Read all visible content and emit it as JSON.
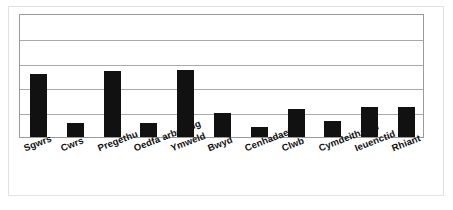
{
  "chart_data": {
    "type": "bar",
    "title": "",
    "subtitle": "",
    "xlabel": "",
    "ylabel": "",
    "grid": true,
    "legend": false,
    "legend_position": "none",
    "axis_tick_labels": [],
    "ylim": [
      0,
      5
    ],
    "y_gridline_values": [
      1,
      2,
      3,
      4,
      5
    ],
    "categories": [
      "Sgwrs",
      "Cwrs",
      "Pregethu",
      "Oedfa arbennig",
      "Ymweld",
      "Bwyd",
      "Cenhadaeth",
      "Clwb",
      "Cymdeithasol",
      "Ieuenctid",
      "Rhiant"
    ],
    "values": [
      2.54,
      0.56,
      2.66,
      0.56,
      2.7,
      0.97,
      0.4,
      1.13,
      0.65,
      1.21,
      1.21
    ],
    "bar_color": "#111111",
    "gridline_color": "#a9a9a9",
    "plot_border_color": "#9a9a9a",
    "background_color": "#ffffff"
  },
  "figure": {
    "outer_border_color": "#e2e2e2"
  }
}
